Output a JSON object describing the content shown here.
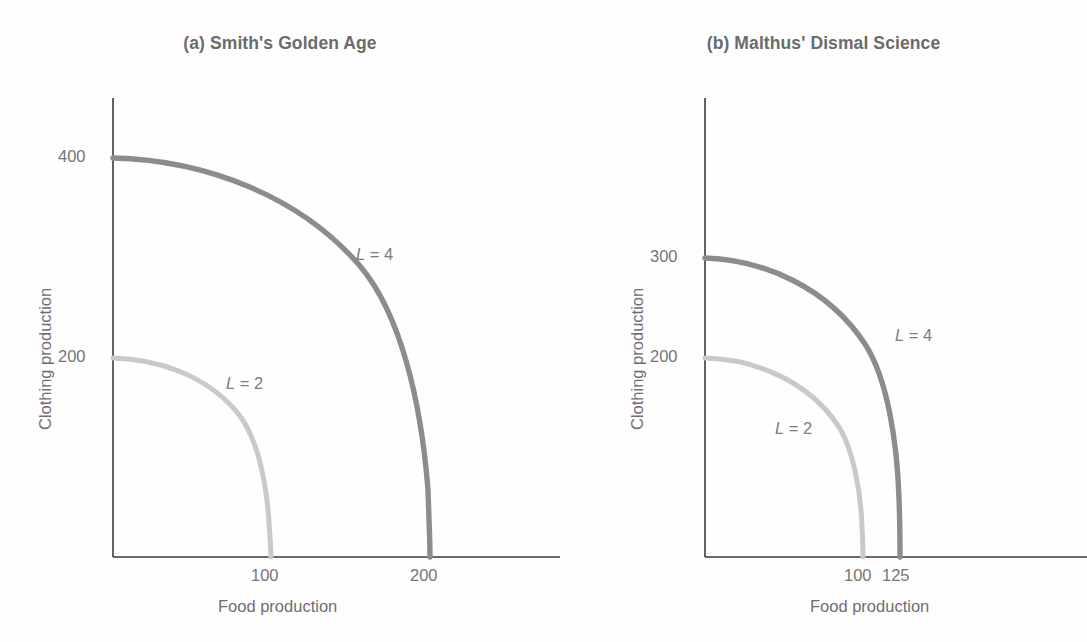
{
  "figure": {
    "background_color": "#ffffff",
    "text_color": "#6e6e6e"
  },
  "panels": [
    {
      "id": "a",
      "title": "(a) Smith's Golden Age",
      "xlabel": "Food production",
      "ylabel": "Clothing production",
      "xticks": [
        "100",
        "200"
      ],
      "yticks": [
        "200",
        "400"
      ],
      "curve_labels": [
        "L = 2",
        "L = 4"
      ]
    },
    {
      "id": "b",
      "title": "(b) Malthus' Dismal Science",
      "xlabel": "Food production",
      "ylabel": "Clothing production",
      "xticks": [
        "100",
        "125"
      ],
      "yticks": [
        "200",
        "300"
      ],
      "curve_labels": [
        "L = 2",
        "L = 4"
      ]
    }
  ],
  "chart_data": [
    {
      "type": "line",
      "panel": "a",
      "title": "(a) Smith's Golden Age",
      "xlabel": "Food production",
      "ylabel": "Clothing production",
      "xlim": [
        0,
        280
      ],
      "ylim": [
        0,
        520
      ],
      "xticks": [
        100,
        200
      ],
      "xticklabels": [
        "100",
        "200"
      ],
      "yticks": [
        200,
        400
      ],
      "yticklabels": [
        "200",
        "400"
      ],
      "grid": false,
      "legend": "inline-annotations",
      "series": [
        {
          "name": "L = 2",
          "color": "#c9c9c9",
          "intercepts": {
            "x": 100,
            "y": 200
          },
          "shape": "concave production possibility frontier",
          "points": [
            {
              "x": 0,
              "y": 200
            },
            {
              "x": 20,
              "y": 198
            },
            {
              "x": 40,
              "y": 192
            },
            {
              "x": 55,
              "y": 184
            },
            {
              "x": 70,
              "y": 168
            },
            {
              "x": 82,
              "y": 148
            },
            {
              "x": 90,
              "y": 124
            },
            {
              "x": 95,
              "y": 98
            },
            {
              "x": 98,
              "y": 62
            },
            {
              "x": 100,
              "y": 0
            }
          ]
        },
        {
          "name": "L = 4",
          "color": "#8c8c8c",
          "intercepts": {
            "x": 200,
            "y": 400
          },
          "shape": "concave production possibility frontier",
          "points": [
            {
              "x": 0,
              "y": 400
            },
            {
              "x": 40,
              "y": 396
            },
            {
              "x": 80,
              "y": 384
            },
            {
              "x": 110,
              "y": 368
            },
            {
              "x": 140,
              "y": 336
            },
            {
              "x": 164,
              "y": 296
            },
            {
              "x": 180,
              "y": 248
            },
            {
              "x": 190,
              "y": 196
            },
            {
              "x": 196,
              "y": 124
            },
            {
              "x": 200,
              "y": 0
            }
          ]
        }
      ]
    },
    {
      "type": "line",
      "panel": "b",
      "title": "(b) Malthus' Dismal Science",
      "xlabel": "Food production",
      "ylabel": "Clothing production",
      "xlim": [
        0,
        215
      ],
      "ylim": [
        0,
        520
      ],
      "xticks": [
        100,
        125
      ],
      "xticklabels": [
        "100",
        "125"
      ],
      "yticks": [
        200,
        300
      ],
      "yticklabels": [
        "200",
        "300"
      ],
      "grid": false,
      "legend": "inline-annotations",
      "series": [
        {
          "name": "L = 2",
          "color": "#c9c9c9",
          "intercepts": {
            "x": 100,
            "y": 200
          },
          "shape": "concave production possibility frontier",
          "points": [
            {
              "x": 0,
              "y": 200
            },
            {
              "x": 20,
              "y": 198
            },
            {
              "x": 40,
              "y": 192
            },
            {
              "x": 58,
              "y": 180
            },
            {
              "x": 72,
              "y": 162
            },
            {
              "x": 84,
              "y": 138
            },
            {
              "x": 92,
              "y": 110
            },
            {
              "x": 96,
              "y": 80
            },
            {
              "x": 99,
              "y": 40
            },
            {
              "x": 100,
              "y": 0
            }
          ]
        },
        {
          "name": "L = 4",
          "color": "#8c8c8c",
          "intercepts": {
            "x": 125,
            "y": 300
          },
          "shape": "concave production possibility frontier",
          "points": [
            {
              "x": 0,
              "y": 300
            },
            {
              "x": 25,
              "y": 296
            },
            {
              "x": 50,
              "y": 286
            },
            {
              "x": 72,
              "y": 268
            },
            {
              "x": 92,
              "y": 240
            },
            {
              "x": 106,
              "y": 204
            },
            {
              "x": 116,
              "y": 160
            },
            {
              "x": 121,
              "y": 114
            },
            {
              "x": 124,
              "y": 58
            },
            {
              "x": 125,
              "y": 0
            }
          ]
        }
      ]
    }
  ],
  "colors": {
    "curve_l2": "#c9c9c9",
    "curve_l4": "#8c8c8c",
    "axis": "#3a3a3a",
    "title": "#6b6b6b",
    "tick_text": "#757575"
  }
}
